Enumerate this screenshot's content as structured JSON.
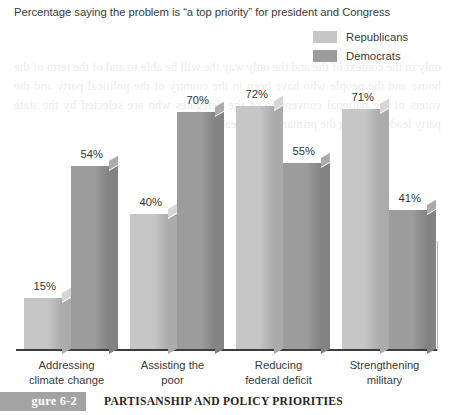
{
  "figure": {
    "title": "Percentage saying the problem is “a top priority” for president and Congress",
    "caption_tag": "gure 6-2",
    "caption_text": "PARTISANSHIP AND POLICY PRIORITIES"
  },
  "colors": {
    "republicans": "#c6c6c6",
    "republicans_side": "#ababab",
    "republicans_top": "#d6d6d6",
    "democrats": "#9c9c9c",
    "democrats_side": "#828282",
    "democrats_top": "#acacac",
    "axis": "#3d3d3d",
    "text": "#3a3a3a",
    "caption_tag_bg": "#a3a3a3"
  },
  "chart_data": {
    "type": "bar",
    "title": "Percentage saying the problem is “a top priority” for president and Congress",
    "xlabel": "",
    "ylabel": "",
    "ylim": [
      0,
      80
    ],
    "grid": false,
    "legend_position": "top-right",
    "value_suffix": "%",
    "categories": [
      "Addressing climate change",
      "Assisting the poor",
      "Reducing federal deficit",
      "Strengthening military"
    ],
    "category_lines": [
      [
        "Addressing",
        "climate change"
      ],
      [
        "Assisting the",
        "poor"
      ],
      [
        "Reducing",
        "federal deficit"
      ],
      [
        "Strengthening",
        "military"
      ]
    ],
    "series": [
      {
        "name": "Republicans",
        "values": [
          15,
          40,
          72,
          71
        ],
        "labels": [
          "15%",
          "40%",
          "72%",
          "71%"
        ]
      },
      {
        "name": "Democrats",
        "values": [
          54,
          70,
          55,
          41
        ],
        "labels": [
          "54%",
          "70%",
          "55%",
          "41%"
        ]
      }
    ]
  },
  "bleed_text": "only in the context of the  and the only way the will be able to and  of the term of the  house and the people  who have been  in the country of the  political party  and the voters of the  national convention  of the delegates who  are selected by the  state party leaders  during the primary  season each year"
}
